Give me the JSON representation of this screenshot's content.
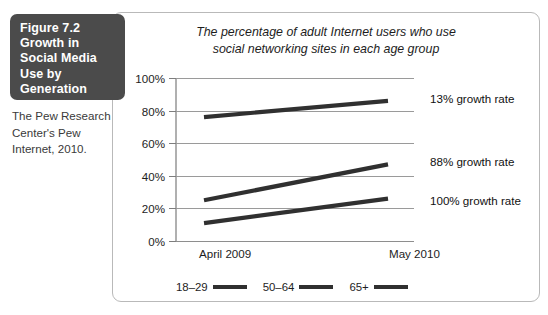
{
  "figure": {
    "title_lines": [
      "Figure 7.2",
      "Growth in",
      "Social Media",
      "Use by",
      "Generation"
    ],
    "caption": "The Pew Research Center's Pew Internet, 2010.",
    "box_color": "#4b4b4b"
  },
  "chart_data": {
    "type": "line",
    "title": "The percentage of adult Internet users who use social networking sites in each age group",
    "title_line_1": "The percentage of adult Internet users who use",
    "title_line_2": "social networking sites in each age group",
    "xlabel": "",
    "ylabel": "",
    "categories": [
      "April 2009",
      "May 2010"
    ],
    "x": [
      "April 2009",
      "May 2010"
    ],
    "ylim": [
      0,
      100
    ],
    "ytick_labels": [
      "100%",
      "80%",
      "60%",
      "40%",
      "20%",
      "0%"
    ],
    "ytick_values": [
      100,
      80,
      60,
      40,
      20,
      0
    ],
    "grid": true,
    "legend_position": "bottom",
    "series": [
      {
        "name": "18–29",
        "values": [
          76,
          86
        ],
        "annotation": "13% growth rate",
        "color": "#303030"
      },
      {
        "name": "50–64",
        "values": [
          25,
          47
        ],
        "annotation": "88% growth rate",
        "color": "#303030"
      },
      {
        "name": "65+",
        "values": [
          11,
          26
        ],
        "annotation": "100% growth rate",
        "color": "#303030"
      }
    ]
  }
}
